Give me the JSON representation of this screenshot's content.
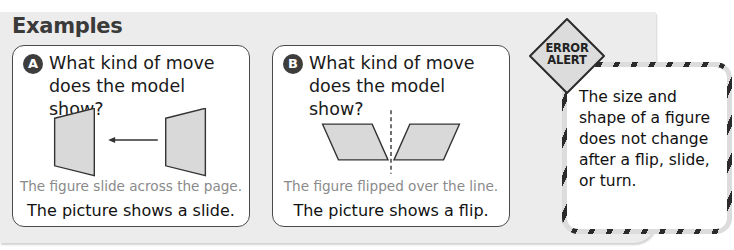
{
  "section": {
    "title": "Examples"
  },
  "examples": [
    {
      "badge": "A",
      "question": "What kind of move does the model show?",
      "figure": "two trapezoids with left-pointing arrow between them",
      "caption": "The figure slide across the page.",
      "answer": "The picture shows a slide."
    },
    {
      "badge": "B",
      "question": "What kind of move does the model show?",
      "figure": "two mirrored parallelograms separated by dashed line",
      "caption": "The figure flipped over the line.",
      "answer": "The picture shows a flip."
    }
  ],
  "error_alert": {
    "label_line1": "ERROR",
    "label_line2": "ALERT",
    "text": "The size and shape of a figure does not change after a flip, slide, or turn."
  },
  "colors": {
    "panel": "#ececec",
    "shape_fill": "#d9d9d9",
    "stroke": "#3a3a3a",
    "caption": "#8a8a8a"
  }
}
